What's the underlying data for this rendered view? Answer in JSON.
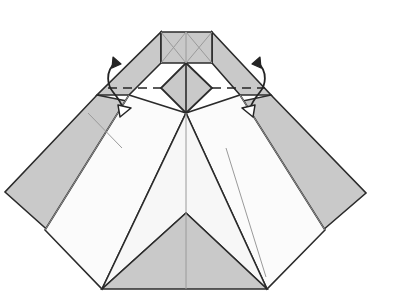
{
  "figure": {
    "canvas": {
      "width": 399,
      "height": 303
    },
    "background_color": "#ffffff"
  },
  "palette": {
    "paper_front_gray": "#c9c9c9",
    "paper_back_white": "#fbfbfb",
    "paper_light_gray": "#efefef",
    "paper_mid_gray": "#d6d6d6",
    "outline_dark": "#2b2b2b",
    "crease_light": "#9a9a9a",
    "fold_line": "#242424"
  },
  "shapes": {
    "top_rectangle": {
      "name": "top-rectangle-panel",
      "fill": "#c9c9c9",
      "points": "161,32 212,32 212,63 161,63"
    },
    "left_upper_wing": {
      "name": "left-upper-wing-panel",
      "fill": "#c9c9c9",
      "points": "161,32 161,63 129,95 97,95"
    },
    "right_upper_wing": {
      "name": "right-upper-wing-panel",
      "fill": "#c9c9c9",
      "points": "212,32 271,95 240,95 212,63"
    },
    "center_diamond": {
      "name": "center-diamond-panel",
      "fill": "#c9c9c9",
      "points": "186,63 212,88 186,113 161,88"
    },
    "left_big_flap": {
      "name": "left-large-flap-panel",
      "fill": "#c9c9c9",
      "points": "97,95 186,113 62,243 5,192"
    },
    "right_big_flap": {
      "name": "right-large-flap-panel",
      "fill": "#c9c9c9",
      "points": "271,95 366,193 308,243 186,113"
    },
    "left_white_underlayer": {
      "name": "left-white-underlayer-panel",
      "fill": "#fbfbfb",
      "points": "129,95 186,113 102,289 45,230"
    },
    "right_white_underlayer": {
      "name": "right-white-underlayer-panel",
      "fill": "#fbfbfb",
      "points": "240,95 325,230 267,289 186,113"
    },
    "center_white_chevron": {
      "name": "center-white-chevron-panel",
      "fill": "#f7f7f7",
      "points": "186,113 267,289 186,213 102,289"
    },
    "bottom_gray_triangle": {
      "name": "bottom-center-gray-triangle",
      "fill": "#c9c9c9",
      "points": "186,213 267,289 102,289"
    }
  },
  "creases": {
    "rect_diag_left": {
      "name": "rect-diagonal-left-crease",
      "d": "M161,32 L186,63"
    },
    "rect_diag_right": {
      "name": "rect-diagonal-right-crease",
      "d": "M212,32 L186,63"
    },
    "rect_diag_left_down": {
      "name": "rect-diagonal-left-lower-crease",
      "d": "M161,63 L186,32"
    },
    "rect_diag_right_down": {
      "name": "rect-diagonal-right-lower-crease",
      "d": "M212,63 L186,32"
    },
    "rect_center_vertical": {
      "name": "rect-center-vertical-crease",
      "d": "M186,32 L186,63"
    },
    "diamond_vertical": {
      "name": "diamond-center-vertical-crease",
      "d": "M186,63 L186,113"
    },
    "center_spine": {
      "name": "center-vertical-spine-crease",
      "d": "M186,113 L186,289"
    },
    "left_flap_short": {
      "name": "left-flap-short-crease",
      "d": "M88,113 L122,148"
    },
    "right_inner_long": {
      "name": "right-inner-long-crease",
      "d": "M226,148 L266,277"
    },
    "left_white_inner": {
      "name": "left-white-inner-crease",
      "d": "M129,95 L45,230"
    },
    "right_white_inner": {
      "name": "right-white-inner-crease",
      "d": "M240,95 L325,230"
    }
  },
  "fold_lines": {
    "horizontal_dashed": {
      "name": "horizontal-valley-fold-dashed-line",
      "style": "dashed",
      "d": "M108,88 L161,88",
      "d2": "M212,88 L265,88"
    }
  },
  "arrows": {
    "left": {
      "name": "left-fold-arrow",
      "description": "curved double-ended fold arrow, solid head up, hollow head down",
      "curve": "M116,62 C104,72 108,86 113,92 C118,98 122,104 124,111",
      "solid_head": "113,57 121,64 112,68",
      "hollow_head": "118,105 131,108 120,117"
    },
    "right": {
      "name": "right-fold-arrow",
      "description": "curved double-ended fold arrow, solid head up, hollow head down",
      "curve": "M257,62 C269,72 265,86 260,92 C255,98 251,104 249,111",
      "solid_head": "260,57 252,64 261,68",
      "hollow_head": "255,105 242,108 253,117"
    }
  }
}
